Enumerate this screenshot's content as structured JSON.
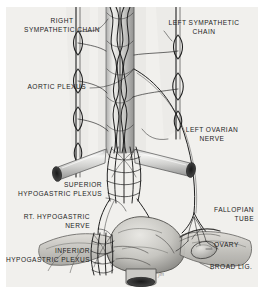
{
  "plate": {
    "kind": "anatomical-illustration",
    "subject": "Autonomic nerve supply of the female pelvis and ovary",
    "medium": "graphite / pen-and-ink drawing",
    "palette": {
      "paper": "#f1f0ed",
      "ink": "#1d1d1d",
      "mid_tone": "#6f6f6f",
      "light_tone": "#bdbdbd",
      "border": "#ffffff"
    },
    "signature": "jm"
  },
  "labels": [
    {
      "id": "right-sympathetic-chain",
      "text": "RIGHT\nSYMPATHETIC CHAIN",
      "align": "center"
    },
    {
      "id": "left-sympathetic-chain",
      "text": "LEFT SYMPATHETIC\nCHAIN",
      "align": "center"
    },
    {
      "id": "aortic-plexus",
      "text": "AORTIC PLEXUS",
      "align": "right"
    },
    {
      "id": "left-ovarian-nerve",
      "text": "LEFT OVARIAN\nNERVE",
      "align": "center"
    },
    {
      "id": "superior-hypogastric-plexus",
      "text": "SUPERIOR\nHYPOGASTRIC PLEXUS",
      "align": "right"
    },
    {
      "id": "rt-hypogastric-nerve",
      "text": "RT. HYPOGASTRIC\nNERVE",
      "align": "right"
    },
    {
      "id": "inferior-hypogastric-plexus",
      "text": "INFERIOR\nHYPOGASTRIC PLEXUS",
      "align": "right"
    },
    {
      "id": "fallopian-tube",
      "text": "FALLOPIAN\nTUBE",
      "align": "right"
    },
    {
      "id": "ovary",
      "text": "OVARY",
      "align": "left"
    },
    {
      "id": "broad-ligament",
      "text": "BROAD LIG.",
      "align": "left"
    }
  ],
  "structures": [
    {
      "id": "aorta",
      "name": "Abdominal aorta with braided aortic plexus"
    },
    {
      "id": "right-sympathetic-trunk",
      "name": "Right sympathetic chain with ganglia"
    },
    {
      "id": "left-sympathetic-trunk",
      "name": "Left sympathetic chain with ganglia"
    },
    {
      "id": "right-common-iliac",
      "name": "Right common iliac artery, cut end"
    },
    {
      "id": "left-common-iliac",
      "name": "Left common iliac artery, cut end"
    },
    {
      "id": "superior-hypogastric-mesh",
      "name": "Superior hypogastric plexus mesh"
    },
    {
      "id": "inferior-hypogastric-mesh",
      "name": "Inferior hypogastric plexus mesh"
    },
    {
      "id": "uterus",
      "name": "Uterine body and fundus"
    },
    {
      "id": "cervix-vagina",
      "name": "Cervix and vaginal cuff, cut"
    },
    {
      "id": "ovary-body",
      "name": "Ovary"
    },
    {
      "id": "fallopian-tube-body",
      "name": "Fallopian tube"
    },
    {
      "id": "broad-ligament-body",
      "name": "Broad ligament"
    }
  ]
}
